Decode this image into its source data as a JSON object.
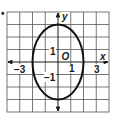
{
  "diagram": {
    "type": "ellipse-graph",
    "bullet": "•",
    "grid": {
      "cols": 8,
      "rows": 8,
      "xmin": -4,
      "xmax": 4,
      "ymin": -4,
      "ymax": 4
    },
    "axes": {
      "x_label": "x",
      "y_label": "y",
      "origin_label": "O"
    },
    "tick_labels": {
      "x_neg3": "−3",
      "x_pos1": "1",
      "x_pos3": "3",
      "y_pos1": "1",
      "y_neg1": "−1"
    },
    "ellipse": {
      "center": [
        0,
        0
      ],
      "semi_x": 2,
      "semi_y": 3
    },
    "colors": {
      "grid": "#555555",
      "axis": "#1a1a1a",
      "curve": "#111111"
    }
  }
}
